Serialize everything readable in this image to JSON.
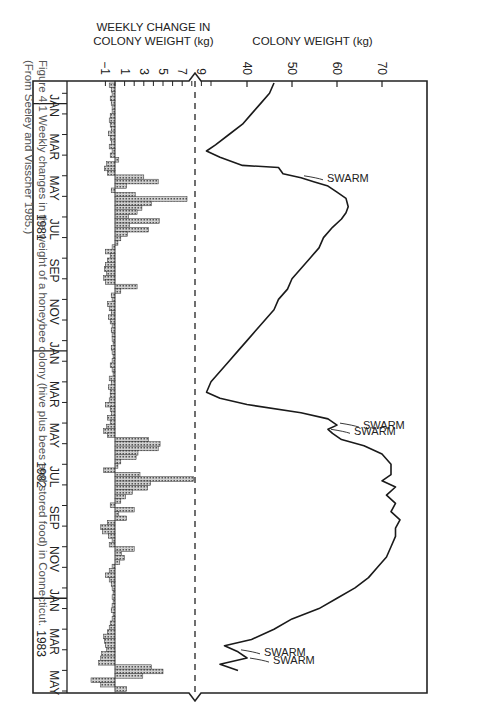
{
  "caption": {
    "line1": "Figure 4.1   Weekly changes in the weight of a honeybee colony (hive plus bees and stored food) in Connecticut.",
    "line2": "(From Seeley and Visscher 1985.)"
  },
  "chart_data": [
    {
      "type": "line",
      "title": "Colony weight over time",
      "xlabel": "",
      "ylabel": "COLONY WEIGHT (kg)",
      "yticks": [
        40,
        50,
        60,
        70
      ],
      "ylim": [
        30,
        80
      ],
      "grid": false,
      "x_unit": "months since Dec 1980",
      "x": [
        0.0,
        0.5,
        1.0,
        1.5,
        2.0,
        2.5,
        3.0,
        3.3,
        3.6,
        4.0,
        4.1,
        4.4,
        4.6,
        4.8,
        5.0,
        5.3,
        5.6,
        6.0,
        6.3,
        6.6,
        7.0,
        7.5,
        8.0,
        8.5,
        9.0,
        9.5,
        10.0,
        10.5,
        11.0,
        11.5,
        12.0,
        12.5,
        13.0,
        13.5,
        14.0,
        14.5,
        15.0,
        15.3,
        15.6,
        16.0,
        16.3,
        16.6,
        16.8,
        17.0,
        17.3,
        17.6,
        18.0,
        18.5,
        19.0,
        19.3,
        19.6,
        20.0,
        20.4,
        20.8,
        21.2,
        21.6,
        22.0,
        22.5,
        23.0,
        23.5,
        24.0,
        24.5,
        25.0,
        25.5,
        26.0,
        26.5,
        27.0,
        27.3,
        27.6,
        27.9,
        28.2,
        28.5
      ],
      "values": [
        46,
        45,
        43,
        41,
        39,
        36,
        33,
        31,
        34,
        39,
        47,
        48,
        52,
        55,
        58,
        60,
        62,
        62.5,
        62,
        61,
        59,
        57,
        56,
        54,
        52,
        50,
        49,
        47,
        46,
        44,
        42,
        40,
        38,
        36,
        34,
        32,
        31,
        34,
        40,
        52,
        58,
        60,
        58,
        59,
        61,
        66,
        70,
        72,
        72,
        70,
        73,
        71,
        73,
        72,
        74,
        73,
        73,
        72,
        71,
        69,
        67,
        64,
        60,
        56,
        50,
        46,
        41,
        35,
        38,
        40,
        34,
        38
      ],
      "annotations": [
        {
          "label": "SWARM",
          "x": 4.6
        },
        {
          "label": "SWARM",
          "x": 16.6
        },
        {
          "label": "SWARM",
          "x": 16.9
        },
        {
          "label": "SWARM",
          "x": 27.6
        },
        {
          "label": "SWARM",
          "x": 28.0
        }
      ]
    },
    {
      "type": "bar",
      "title": "Weekly change in colony weight",
      "ylabel": "WEEKLY CHANGE IN COLONY WEIGHT (kg)",
      "yticks": [
        -1,
        1,
        3,
        5,
        7,
        9
      ],
      "ylim": [
        -1.5,
        10
      ],
      "x_unit": "weeks since Dec 1980",
      "values": [
        -0.6,
        -0.4,
        -0.3,
        -0.5,
        -0.4,
        -0.3,
        -0.3,
        -0.5,
        -0.6,
        -0.5,
        -0.4,
        -0.7,
        -0.5,
        -0.4,
        -0.6,
        -0.3,
        -0.5,
        0.4,
        -0.9,
        -1.1,
        -0.8,
        3.0,
        4.5,
        1.2,
        -0.4,
        2.1,
        7.5,
        3.8,
        2.8,
        2.3,
        1.4,
        4.6,
        1.5,
        3.5,
        1.3,
        0.6,
        0.3,
        -0.3,
        -1.0,
        -0.5,
        -0.8,
        -1.0,
        -1.1,
        -0.9,
        -1.2,
        -1.0,
        2.3,
        0.6,
        -0.4,
        -0.3,
        -0.8,
        -0.6,
        -0.4,
        -0.7,
        -0.5,
        -0.3,
        -0.4,
        -0.3,
        -0.3,
        -0.2,
        -0.4,
        -0.3,
        -0.2,
        -0.3,
        -0.5,
        -0.3,
        -0.2,
        -0.6,
        -0.4,
        -0.7,
        -0.5,
        -0.5,
        -0.6,
        -1.0,
        -0.5,
        -0.4,
        -0.8,
        -0.5,
        -0.9,
        -1.2,
        -0.8,
        3.5,
        4.7,
        4.5,
        2.4,
        2.2,
        0.6,
        0.3,
        -1.2,
        2.6,
        8.2,
        3.7,
        3.4,
        1.8,
        1.1,
        0.6,
        -0.5,
        2.0,
        0.4,
        1.2,
        -0.8,
        -1.5,
        -1.3,
        -0.7,
        -0.3,
        -0.6,
        2.0,
        0.7,
        1.0,
        0.5,
        -0.3,
        -0.6,
        -1.0,
        -0.6,
        -0.4,
        -0.3,
        -0.2,
        -0.3,
        -0.2,
        -0.3,
        -0.4,
        -0.2,
        -0.3,
        -0.5,
        -0.6,
        -0.8,
        -1.2,
        -1.1,
        -1.0,
        -0.9,
        -1.4,
        -1.5,
        -1.7,
        3.8,
        5.0,
        2.9,
        -2.5,
        -1.5,
        1.2
      ]
    }
  ],
  "time_axis": {
    "months": [
      "JAN",
      "MAR",
      "MAY",
      "JUL",
      "SEP",
      "NOV",
      "JAN",
      "MAR",
      "MAY",
      "JUL",
      "SEP",
      "NOV",
      "JAN",
      "MAR",
      "MAY"
    ],
    "month_offsets": [
      1,
      3,
      5,
      7,
      9,
      11,
      13,
      15,
      17,
      19,
      21,
      23,
      25,
      27,
      29
    ],
    "years": [
      {
        "label": "1981",
        "offset": 7
      },
      {
        "label": "1982",
        "offset": 19
      },
      {
        "label": "1983",
        "offset": 27.2
      }
    ]
  },
  "labels": {
    "weight_axis": "COLONY WEIGHT (kg)",
    "change_axis_line1": "WEEKLY CHANGE IN",
    "change_axis_line2": "COLONY WEIGHT (kg)",
    "swarm": "SWARM"
  }
}
